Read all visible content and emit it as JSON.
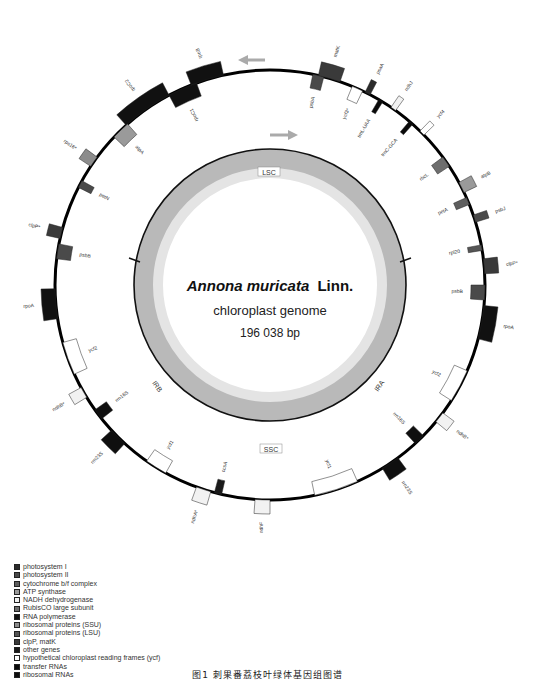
{
  "figure": {
    "title_species": "Annona muricata",
    "title_authority": "Linn.",
    "subtitle": "chloroplast genome",
    "size": "196 038 bp",
    "caption": "图1   刺果番荔枝叶绿体基因组图谱"
  },
  "regions": {
    "lsc": "LSC",
    "ssc": "SSC",
    "ira": "IRA",
    "irb": "IRB"
  },
  "legend": [
    {
      "label": "photosystem I",
      "color": "#2b2b2b"
    },
    {
      "label": "photosystem II",
      "color": "#4a4a4a"
    },
    {
      "label": "cytochrome b/f complex",
      "color": "#5e5e5e"
    },
    {
      "label": "ATP synthase",
      "color": "#9a9a9a"
    },
    {
      "label": "NADH dehydrogenase",
      "color": "#f2f2f2"
    },
    {
      "label": "RubisCO large subunit",
      "color": "#6e6e6e"
    },
    {
      "label": "RNA polymerase",
      "color": "#111111"
    },
    {
      "label": "ribosomal proteins (SSU)",
      "color": "#8c8c8c"
    },
    {
      "label": "ribosomal proteins (LSU)",
      "color": "#555555"
    },
    {
      "label": "clpP, matK",
      "color": "#3a3a3a"
    },
    {
      "label": "other genes",
      "color": "#1a1a1a"
    },
    {
      "label": "hypothetical chloroplast reading frames (ycf)",
      "color": "#ffffff"
    },
    {
      "label": "transfer RNAs",
      "color": "#0a0a0a"
    },
    {
      "label": "ribosomal RNAs",
      "color": "#0f0f0f"
    }
  ],
  "chart_data": {
    "type": "circular-genome-map",
    "title": "Annona muricata Linn. chloroplast genome",
    "genome_length_bp": 196038,
    "regions": [
      "LSC",
      "IRA",
      "SSC",
      "IRB"
    ],
    "genes_outside": [
      {
        "name": "rpoC2",
        "angle": -35,
        "len": 14,
        "color": "#111111"
      },
      {
        "name": "rpoC1",
        "angle": -24,
        "len": 8,
        "color": "#111111"
      },
      {
        "name": "rpoB",
        "angle": -17,
        "len": 9,
        "color": "#111111"
      },
      {
        "name": "psbA",
        "angle": 13,
        "len": 3,
        "color": "#4a4a4a"
      },
      {
        "name": "matK",
        "angle": 16,
        "len": 6,
        "color": "#3a3a3a"
      },
      {
        "name": "ycf3*",
        "angle": 24,
        "len": 3,
        "color": "#ffffff"
      },
      {
        "name": "psaA",
        "angle": 27,
        "len": 1.5,
        "color": "#2b2b2b"
      },
      {
        "name": "trnL-UAA",
        "angle": 31,
        "len": 1.2,
        "color": "#0a0a0a"
      },
      {
        "name": "ndhJ",
        "angle": 35,
        "len": 1.5,
        "color": "#f2f2f2"
      },
      {
        "name": "trnC-GCA",
        "angle": 41,
        "len": 1.2,
        "color": "#0a0a0a"
      },
      {
        "name": "ycf4",
        "angle": 45,
        "len": 1.5,
        "color": "#ffffff"
      },
      {
        "name": "rbcL",
        "angle": 55,
        "len": 3,
        "color": "#6e6e6e"
      },
      {
        "name": "atpB",
        "angle": 63,
        "len": 3,
        "color": "#9a9a9a"
      },
      {
        "name": "petA",
        "angle": 67,
        "len": 2,
        "color": "#5e5e5e"
      },
      {
        "name": "psbJ",
        "angle": 72,
        "len": 2,
        "color": "#4a4a4a"
      },
      {
        "name": "rpl20",
        "angle": 80,
        "len": 1.5,
        "color": "#555555"
      },
      {
        "name": "clpP*",
        "angle": 85,
        "len": 4,
        "color": "#3a3a3a"
      },
      {
        "name": "psbB",
        "angle": 92,
        "len": 4,
        "color": "#4a4a4a"
      },
      {
        "name": "rpoA",
        "angle": 100,
        "len": 9,
        "color": "#111111"
      },
      {
        "name": "ycf2",
        "angle": 118,
        "len": 9,
        "color": "#ffffff"
      },
      {
        "name": "ndhB*",
        "angle": 128,
        "len": 3,
        "color": "#f2f2f2"
      },
      {
        "name": "rrn16S",
        "angle": 136,
        "len": 3,
        "color": "#0f0f0f"
      },
      {
        "name": "rrn23S",
        "angle": 146,
        "len": 5,
        "color": "#0f0f0f"
      },
      {
        "name": "ycf1",
        "angle": 162,
        "len": 12,
        "color": "#ffffff"
      },
      {
        "name": "ndhF",
        "angle": 182,
        "len": 4,
        "color": "#f2f2f2"
      },
      {
        "name": "ccsA",
        "angle": 194,
        "len": 2,
        "color": "#1a1a1a"
      },
      {
        "name": "ndhA*",
        "angle": 198,
        "len": 4,
        "color": "#f2f2f2"
      },
      {
        "name": "ycf1",
        "angle": 212,
        "len": 6,
        "color": "#ffffff"
      },
      {
        "name": "rrn23S",
        "angle": 225,
        "len": 5,
        "color": "#0f0f0f"
      },
      {
        "name": "rrn16S",
        "angle": 233,
        "len": 3,
        "color": "#0f0f0f"
      },
      {
        "name": "ndhB*",
        "angle": 240,
        "len": 3,
        "color": "#f2f2f2"
      },
      {
        "name": "ycf2",
        "angle": 250,
        "len": 9,
        "color": "#ffffff"
      },
      {
        "name": "rpoA",
        "angle": 265,
        "len": 8,
        "color": "#111111"
      },
      {
        "name": "psbB",
        "angle": 279,
        "len": 4,
        "color": "#4a4a4a"
      },
      {
        "name": "clpP*",
        "angle": 284,
        "len": 3,
        "color": "#3a3a3a"
      },
      {
        "name": "petN",
        "angle": 298,
        "len": 2,
        "color": "#4a4a4a"
      },
      {
        "name": "rps16*",
        "angle": 305,
        "len": 3,
        "color": "#8c8c8c"
      },
      {
        "name": "atpA",
        "angle": 316,
        "len": 5,
        "color": "#9a9a9a"
      }
    ]
  }
}
